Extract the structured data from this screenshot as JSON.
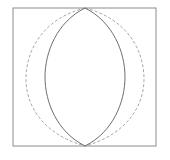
{
  "figure": {
    "title": "",
    "canvas": {
      "width": 170,
      "height": 160,
      "background": "#ffffff"
    },
    "frame": {
      "name": "plot-frame",
      "x": 13,
      "y": 8,
      "width": 143,
      "height": 138,
      "stroke": "#8c8c8c",
      "stroke_width": 1,
      "fill": "#ffffff"
    },
    "curves": [
      {
        "name": "solid-lens-left-arc",
        "style": "solid",
        "stroke": "#6e6e6e",
        "stroke_width": 1,
        "path": "M 85 8 C 57 22, 45 52, 45 77 C 45 102, 57 132, 85 146"
      },
      {
        "name": "solid-lens-right-arc",
        "style": "solid",
        "stroke": "#6e6e6e",
        "stroke_width": 1,
        "path": "M 85 8 C 113 22, 125 52, 125 77 C 125 102, 113 132, 85 146"
      },
      {
        "name": "dashed-lens-left-arc",
        "style": "dashed",
        "stroke": "#a8a8a8",
        "stroke_width": 1,
        "dash_pattern": "3 2",
        "path": "M 85 8 C 45 18, 26 48, 26 79 C 26 110, 48 136, 85 146"
      },
      {
        "name": "dashed-lens-right-arc",
        "style": "dashed",
        "stroke": "#a8a8a8",
        "stroke_width": 1,
        "dash_pattern": "3 2",
        "path": "M 85 8 C 125 18, 144 48, 144 79 C 144 110, 122 136, 85 146"
      }
    ],
    "vertices": {
      "top": {
        "x": 85,
        "y": 8
      },
      "bottom": {
        "x": 85,
        "y": 146
      }
    },
    "labels": []
  }
}
